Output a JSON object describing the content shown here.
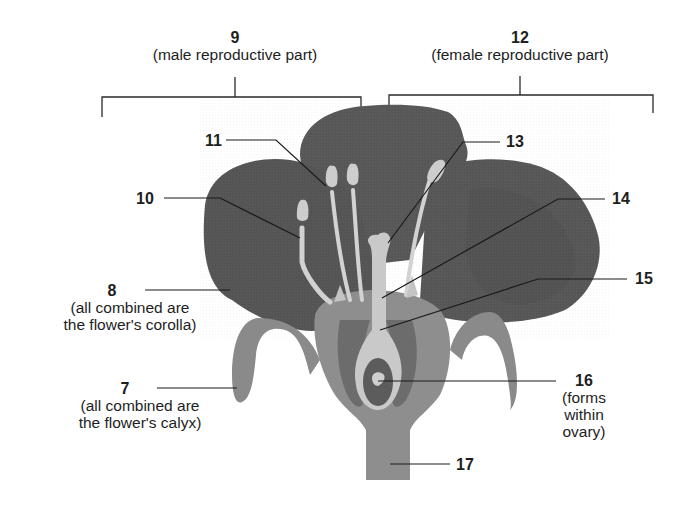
{
  "diagram": {
    "colors": {
      "background": "#ffffff",
      "petal": "#5a5a5a",
      "petal_dark": "#4e4e4e",
      "sepal": "#8a8a8a",
      "receptacle": "#8f8f8f",
      "stamen": "#d2d2d2",
      "pistil": "#c6c6c6",
      "ovary_wall": "#6e6e6e",
      "leader_line": "#1a1a1a"
    },
    "labels": {
      "l9": {
        "number": "9",
        "note": "(male reproductive part)"
      },
      "l12": {
        "number": "12",
        "note": "(female reproductive part)"
      },
      "l11": {
        "number": "11"
      },
      "l13": {
        "number": "13"
      },
      "l10": {
        "number": "10"
      },
      "l14": {
        "number": "14"
      },
      "l15": {
        "number": "15"
      },
      "l8": {
        "number": "8",
        "note_line1": "(all combined are",
        "note_line2": "the flower's corolla)"
      },
      "l7": {
        "number": "7",
        "note_line1": "(all combined are",
        "note_line2": "the flower's calyx)"
      },
      "l16": {
        "number": "16",
        "note_line1": "(forms",
        "note_line2": "within",
        "note_line3": "ovary)"
      },
      "l17": {
        "number": "17"
      }
    }
  }
}
